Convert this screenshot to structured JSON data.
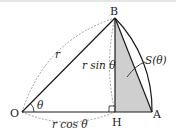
{
  "diagram": {
    "points": {
      "O": {
        "label": "O",
        "x": 22,
        "y": 112
      },
      "H": {
        "label": "H",
        "x": 115,
        "y": 112
      },
      "A": {
        "label": "A",
        "x": 152,
        "y": 112
      },
      "B": {
        "label": "B",
        "x": 115,
        "y": 18
      }
    },
    "labels": {
      "radius": "r",
      "angle": "θ",
      "height": "r sin θ",
      "base": "r cos θ",
      "area": "S(θ)"
    },
    "colors": {
      "stroke": "#1a1a1a",
      "dashed": "#8a8a8a",
      "shade": "#cfcfcf"
    }
  }
}
